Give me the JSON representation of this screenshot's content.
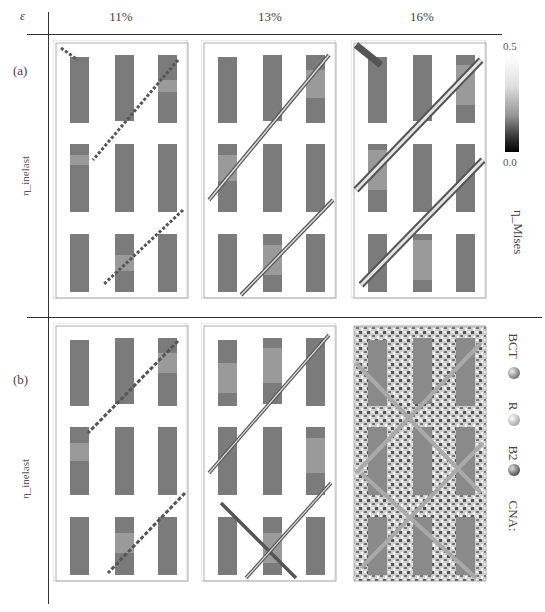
{
  "header": {
    "epsilon_label": "ε",
    "columns": [
      "11%",
      "13%",
      "16%"
    ]
  },
  "rows": [
    {
      "label": "(a)",
      "side_label": "η_inelast",
      "description": "von Mises shear strain maps"
    },
    {
      "label": "(b)",
      "side_label": "η_inelast",
      "description": "CNA structure maps"
    }
  ],
  "colorbar": {
    "max_label": "0.5",
    "min_label": "0.0",
    "axis_label": "η_Mises"
  },
  "cna_legend": {
    "title": "CNA:",
    "items": [
      {
        "label": "B2",
        "color": "#6a6a6a"
      },
      {
        "label": "R",
        "color": "#b5b5b5"
      },
      {
        "label": "BCT",
        "color": "#7a7a7a"
      }
    ]
  },
  "colors": {
    "precipitate": "#7b7b7b",
    "transformed": "#9a9a9a",
    "band": "#555555",
    "band_light": "#d8d8d8"
  }
}
